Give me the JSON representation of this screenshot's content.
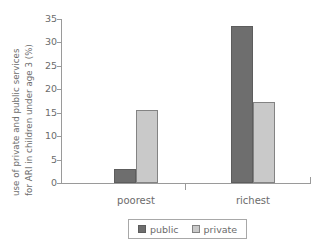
{
  "chart_data": {
    "type": "bar",
    "title": "",
    "subtitle": "",
    "xlabel": "",
    "ylabel": "use of private and public services for ARI in children under age 3 (%)",
    "ylabel_lines": [
      "use of private and public services",
      "for ARI in children under age 3 (%)"
    ],
    "categories": [
      "poorest",
      "richest"
    ],
    "series": [
      {
        "name": "public",
        "values": [
          3,
          33.5
        ],
        "color": "#6e6e6e"
      },
      {
        "name": "private",
        "values": [
          15.6,
          17.3
        ],
        "color": "#c9c9c9"
      }
    ],
    "ylim": [
      0,
      35
    ],
    "yticks": [
      0,
      5,
      10,
      15,
      20,
      25,
      30,
      35
    ],
    "ytick_labels": [
      "0",
      "5",
      "10",
      "15",
      "20",
      "25",
      "30",
      "35"
    ],
    "grid": false,
    "legend": {
      "position": "bottom",
      "entries": [
        {
          "label": "public",
          "color": "#6e6e6e"
        },
        {
          "label": "private",
          "color": "#c9c9c9"
        }
      ]
    },
    "axis_color": "#9a9a9a",
    "text_color": "#6b6b6b",
    "background": "#ffffff"
  }
}
